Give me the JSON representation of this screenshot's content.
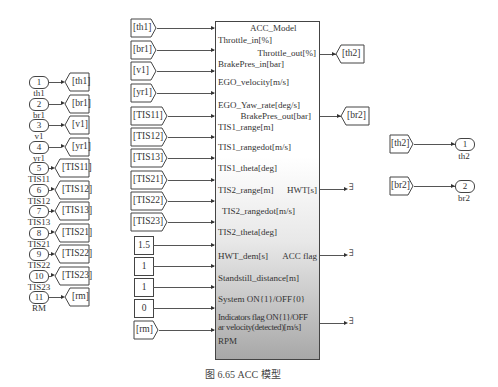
{
  "inports_left": [
    {
      "num": "1",
      "label": "th1",
      "goto": "[th1]"
    },
    {
      "num": "2",
      "label": "br1",
      "goto": "[br1]"
    },
    {
      "num": "3",
      "label": "v1",
      "goto": "[v1]"
    },
    {
      "num": "4",
      "label": "yr1",
      "goto": "[yr1]"
    },
    {
      "num": "5",
      "label": "TIS11",
      "goto": "[TIS11]"
    },
    {
      "num": "6",
      "label": "TIS12",
      "goto": "[TIS12]"
    },
    {
      "num": "7",
      "label": "TIS13",
      "goto": "[TIS13]"
    },
    {
      "num": "8",
      "label": "TIS21",
      "goto": "[TIS21]"
    },
    {
      "num": "9",
      "label": "TIS22",
      "goto": "[TIS22]"
    },
    {
      "num": "10",
      "label": "TIS23",
      "goto": "[TIS23]"
    },
    {
      "num": "11",
      "label": "RM",
      "goto": "[rm]"
    }
  ],
  "model": {
    "title": "ACC_Model",
    "inputs": [
      {
        "source": "[th1]",
        "port": "Throttle_in[%]",
        "type": "from"
      },
      {
        "source": "[br1]",
        "port": "BrakePres_in[bar]",
        "type": "from"
      },
      {
        "source": "[v1]",
        "port": "EGO_velocity[m/s]",
        "type": "from"
      },
      {
        "source": "[yr1]",
        "port": "EGO_Yaw_rate[deg/s]",
        "type": "from"
      },
      {
        "source": "[TIS11]",
        "port": "TIS1_range[m]",
        "type": "from"
      },
      {
        "source": "[TIS12]",
        "port": "TIS1_rangedot[m/s]",
        "type": "from"
      },
      {
        "source": "[TIS13]",
        "port": "TIS1_theta[deg]",
        "type": "from"
      },
      {
        "source": "[TIS21]",
        "port": "TIS2_range[m]",
        "type": "from"
      },
      {
        "source": "[TIS22]",
        "port": "TIS2_rangedot[m/s]",
        "type": "from"
      },
      {
        "source": "[TIS23]",
        "port": "TIS2_theta[deg]",
        "type": "from"
      },
      {
        "source": "1.5",
        "port": "HWT_dem[s]",
        "type": "const"
      },
      {
        "source": "1",
        "port": "Standstill_distance[m]",
        "type": "const"
      },
      {
        "source": "1",
        "port": "System ON{1}/OFF{0}",
        "type": "const"
      },
      {
        "source": "0",
        "port": "Indicators flag ON{1}/OFF",
        "type": "const"
      },
      {
        "source": "[rm]",
        "port": "RPM",
        "type": "from"
      }
    ],
    "outputs": [
      {
        "port": "Throttle_out[%]",
        "dest": "[th2]"
      },
      {
        "port": "BrakePres_out[bar]",
        "dest": "[br2]"
      },
      {
        "port": "HWT[s]",
        "dest": "terminator"
      },
      {
        "port": "ACC flag",
        "dest": "terminator"
      },
      {
        "port": "ar velocity(detected)[m/s]",
        "dest": "terminator"
      }
    ]
  },
  "outports_right": [
    {
      "from": "[th2]",
      "num": "1",
      "label": "th2"
    },
    {
      "from": "[br2]",
      "num": "2",
      "label": "br2"
    }
  ],
  "caption": "图 6.65   ACC 模型"
}
